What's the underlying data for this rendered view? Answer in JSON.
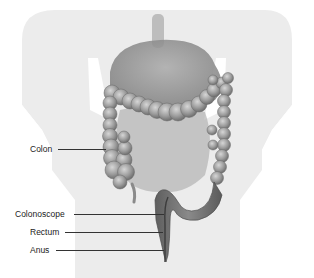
{
  "figure": {
    "type": "anatomical-illustration",
    "labels": [
      {
        "text": "Colon"
      },
      {
        "text": "Colonoscope"
      },
      {
        "text": "Rectum"
      },
      {
        "text": "Anus"
      }
    ]
  },
  "colors": {
    "background": "#ffffff",
    "silhouette": "#ececec",
    "organ_dark": "#7a7a7a",
    "organ_mid": "#9a9a9a",
    "organ_light": "#bdbdbd",
    "label_text": "#222222"
  }
}
